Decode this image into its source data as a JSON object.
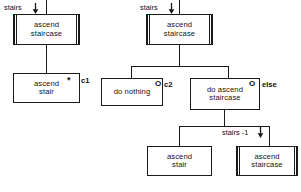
{
  "diagram": {
    "line_color": "#1a1a1a",
    "background": "#ffffff",
    "trees": [
      {
        "id": "left-tree",
        "name": "simple-decomposition",
        "input_label": {
          "text": "stairs",
          "arrow": "down-arrow"
        },
        "root": {
          "name": "ascend-staircase-root",
          "line1": "ascend",
          "line2": "staircase",
          "style": "double-bar"
        },
        "children": [
          {
            "name": "ascend-stair",
            "line1": "ascend",
            "line2": "stair",
            "style": "plain",
            "loop_marker": "*",
            "condition_label": "c1"
          }
        ]
      },
      {
        "id": "right-tree",
        "name": "conditional-decomposition",
        "input_label": {
          "text": "stairs",
          "arrow": "down-arrow"
        },
        "root": {
          "name": "ascend-staircase-root",
          "line1": "ascend",
          "line2": "staircase",
          "style": "double-bar"
        },
        "children": [
          {
            "name": "do-nothing",
            "line1": "do nothing",
            "line2": "",
            "style": "plain",
            "choice_marker": "O",
            "condition_label": "c2"
          },
          {
            "name": "do-ascend-staircase",
            "line1": "do ascend",
            "line2": "staircase",
            "style": "plain",
            "choice_marker": "O",
            "condition_label": "else",
            "children": [
              {
                "name": "ascend-stair",
                "line1": "ascend",
                "line2": "stair",
                "style": "plain"
              },
              {
                "name": "ascend-staircase-recursive",
                "line1": "ascend",
                "line2": "staircase",
                "style": "double-bar",
                "edge_label": {
                  "text": "stairs -1",
                  "arrow": "down-arrow"
                }
              }
            ]
          }
        ]
      }
    ]
  }
}
